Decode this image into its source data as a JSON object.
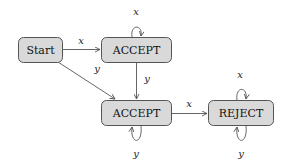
{
  "diagram": {
    "type": "state-machine",
    "nodes": [
      {
        "id": "start",
        "label": "Start"
      },
      {
        "id": "accept1",
        "label": "ACCEPT"
      },
      {
        "id": "accept2",
        "label": "ACCEPT"
      },
      {
        "id": "reject",
        "label": "REJECT"
      }
    ],
    "edges": [
      {
        "from": "start",
        "to": "accept1",
        "label": "x"
      },
      {
        "from": "start",
        "to": "accept2",
        "label": "y"
      },
      {
        "from": "accept1",
        "to": "accept1",
        "label": "x"
      },
      {
        "from": "accept1",
        "to": "accept2",
        "label": "y"
      },
      {
        "from": "accept2",
        "to": "accept2",
        "label": "y"
      },
      {
        "from": "accept2",
        "to": "reject",
        "label": "x"
      },
      {
        "from": "reject",
        "to": "reject",
        "label": "x"
      },
      {
        "from": "reject",
        "to": "reject",
        "label": "y"
      }
    ]
  },
  "colors": {
    "node_fill": "#d9d9d9",
    "node_stroke": "#555555",
    "edge": "#555555"
  }
}
